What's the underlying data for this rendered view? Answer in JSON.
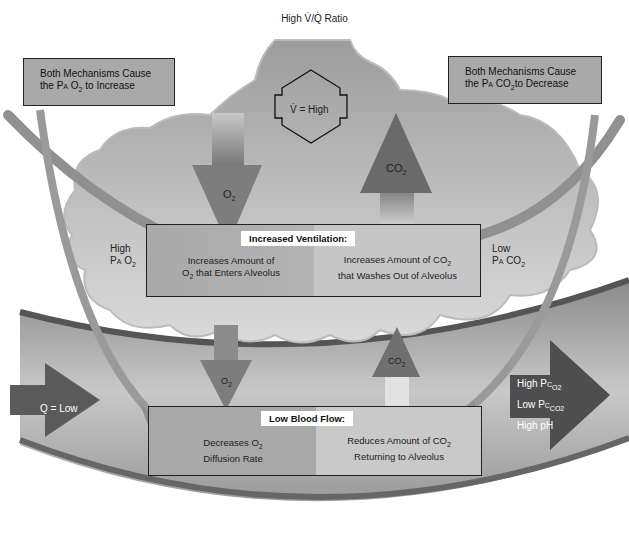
{
  "title": "High V̇/Q̇ Ratio",
  "notes": {
    "left": {
      "line1": "Both Mechanisms Cause",
      "line2_pre": "the ",
      "p": "P",
      "p_sub": "A",
      "gas": "O",
      "gas_sub": "2",
      "line2_post": " to Increase"
    },
    "right": {
      "line1": "Both Mechanisms Cause",
      "line2_pre": "the ",
      "p": "P",
      "p_sub": "A",
      "gas": "CO",
      "gas_sub": "2",
      "line2_post": "to Decrease"
    }
  },
  "alveolus": {
    "ventilation_label": "V̇ = High",
    "o2_arrow": {
      "gas": "O",
      "sub": "2"
    },
    "co2_arrow": {
      "gas": "CO",
      "sub": "2"
    },
    "left_side": {
      "line1": "High",
      "p": "P",
      "p_sub": "A",
      "gas": "O",
      "gas_sub": "2"
    },
    "right_side": {
      "line1": "Low",
      "p": "P",
      "p_sub": "A",
      "gas": "CO",
      "gas_sub": "2"
    }
  },
  "ventilation_box": {
    "header": "Increased Ventilation:",
    "left_line1": "Increases Amount of",
    "left_line2_pre": "O",
    "left_line2_sub": "2",
    "left_line2_post": " that Enters Alveolus",
    "right_line1_pre": "Increases Amount of CO",
    "right_line1_sub": "2",
    "right_line2": "that Washes Out of Alveolus"
  },
  "capillary": {
    "o2_arrow": {
      "gas": "O",
      "sub": "2"
    },
    "co2_arrow": {
      "gas": "CO",
      "sub": "2"
    },
    "inflow_label": "Q = Low",
    "outflow": [
      {
        "pre": "High ",
        "p": "P",
        "p_sub": "C",
        "gas": "O",
        "gas_sub": "2"
      },
      {
        "pre": "Low ",
        "p": "P",
        "p_sub": "C",
        "gas": "CO",
        "gas_sub": "2"
      },
      {
        "pre": "High pH",
        "p": "",
        "p_sub": "",
        "gas": "",
        "gas_sub": ""
      }
    ]
  },
  "blood_flow_box": {
    "header": "Low Blood Flow:",
    "left_line1_pre": "Decreases O",
    "left_line1_sub": "2",
    "left_line2": "Diffusion Rate",
    "right_line1_pre": "Reduces Amount of CO",
    "right_line1_sub": "2",
    "right_line2": "Returning to Alveolus"
  },
  "colors": {
    "cloud": "#a4a4a4",
    "capillary_dark": "#6e6e6e",
    "arrow_dark": "#5a5a5a",
    "note_bg": "#a9a9a9"
  }
}
